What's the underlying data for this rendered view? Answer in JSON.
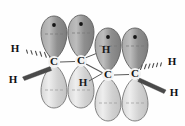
{
  "figure": {
    "name": "orbital-diagram-butadiene",
    "background_color": "#fefefe",
    "border_color": "#d8d8d8"
  },
  "molecule": {
    "bond_color": "#5a5a5a",
    "wedge_color": "#4a4a4a",
    "lobe_top_fill_dark": "#8e8e8e",
    "lobe_top_fill_light": "#c9c9c9",
    "lobe_bottom_fill_dark": "#cfcfcf",
    "lobe_bottom_fill_light": "#efefef",
    "lobe_stroke": "#6b6b6b",
    "electron_dot_color": "#1a1a1a",
    "node_dash_color": "#8a8a8a"
  },
  "atoms": {
    "carbons": [
      {
        "id": "C1",
        "label": "C",
        "x": 54,
        "y": 62
      },
      {
        "id": "C2",
        "label": "C",
        "x": 81,
        "y": 61
      },
      {
        "id": "C3",
        "label": "C",
        "x": 108,
        "y": 75
      },
      {
        "id": "C4",
        "label": "C",
        "x": 135,
        "y": 74
      }
    ],
    "hydrogens": [
      {
        "id": "H1",
        "label": "H",
        "x": 15,
        "y": 49,
        "attached_to": "C1",
        "bond_style": "hashed-wedge",
        "position": "upper-left"
      },
      {
        "id": "H2",
        "label": "H",
        "x": 13,
        "y": 80,
        "attached_to": "C1",
        "bond_style": "solid-wedge",
        "position": "lower-left"
      },
      {
        "id": "H3",
        "label": "H",
        "x": 172,
        "y": 62,
        "attached_to": "C4",
        "bond_style": "hashed-wedge",
        "position": "upper-right"
      },
      {
        "id": "H4",
        "label": "H",
        "x": 174,
        "y": 93,
        "attached_to": "C4",
        "bond_style": "solid-wedge",
        "position": "lower-right"
      },
      {
        "id": "H5",
        "label": "H",
        "x": 106,
        "y": 50,
        "attached_to": "C2",
        "bond_style": "plain-line",
        "position": "on-upper-lobe"
      },
      {
        "id": "H6",
        "label": "H",
        "x": 83,
        "y": 83,
        "attached_to": "C3",
        "bond_style": "plain-line",
        "position": "on-lower-lobe"
      }
    ]
  },
  "bonds": [
    {
      "id": "bond-C1-C2",
      "from": "C1",
      "to": "C2",
      "style": "line"
    },
    {
      "id": "bond-C2-C3",
      "from": "C2",
      "to": "C3",
      "style": "line"
    },
    {
      "id": "bond-C3-C4",
      "from": "C3",
      "to": "C4",
      "style": "line"
    },
    {
      "id": "bond-C1-H1",
      "from": "C1",
      "to": "H1",
      "style": "hashed-wedge"
    },
    {
      "id": "bond-C1-H2",
      "from": "C1",
      "to": "H2",
      "style": "solid-wedge"
    },
    {
      "id": "bond-C4-H3",
      "from": "C4",
      "to": "H3",
      "style": "hashed-wedge"
    },
    {
      "id": "bond-C4-H4",
      "from": "C4",
      "to": "H4",
      "style": "solid-wedge"
    },
    {
      "id": "bond-C2-H5",
      "from": "C2",
      "to": "H5",
      "style": "line"
    },
    {
      "id": "bond-C3-H6",
      "from": "C3",
      "to": "H6",
      "style": "line"
    }
  ],
  "orbitals": [
    {
      "id": "p-C1-top",
      "carbon": "C1",
      "half": "top",
      "cx": 54,
      "cy": 36,
      "shade": "dark",
      "electron_dot": true
    },
    {
      "id": "p-C1-bottom",
      "carbon": "C1",
      "half": "bottom",
      "cx": 54,
      "cy": 88,
      "shade": "light",
      "electron_dot": false
    },
    {
      "id": "p-C2-top",
      "carbon": "C2",
      "half": "top",
      "cx": 81,
      "cy": 35,
      "shade": "dark",
      "electron_dot": true
    },
    {
      "id": "p-C2-bottom",
      "carbon": "C2",
      "half": "bottom",
      "cx": 81,
      "cy": 88,
      "shade": "light",
      "electron_dot": false
    },
    {
      "id": "p-C3-top",
      "carbon": "C3",
      "half": "top",
      "cx": 108,
      "cy": 48,
      "shade": "dark",
      "electron_dot": true
    },
    {
      "id": "p-C3-bottom",
      "carbon": "C3",
      "half": "bottom",
      "cx": 108,
      "cy": 101,
      "shade": "light",
      "electron_dot": false
    },
    {
      "id": "p-C4-top",
      "carbon": "C4",
      "half": "top",
      "cx": 135,
      "cy": 48,
      "shade": "dark",
      "electron_dot": true
    },
    {
      "id": "p-C4-bottom",
      "carbon": "C4",
      "half": "bottom",
      "cx": 135,
      "cy": 101,
      "shade": "light",
      "electron_dot": false
    }
  ]
}
